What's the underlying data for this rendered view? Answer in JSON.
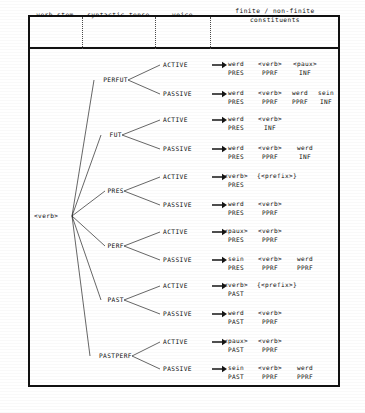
{
  "header": {
    "columns": [
      {
        "label": "verb stem",
        "lines": [
          "verb stem"
        ]
      },
      {
        "label": "syntactic tense",
        "lines": [
          "syntactic tense"
        ]
      },
      {
        "label": "voice",
        "lines": [
          "voice"
        ]
      },
      {
        "label": "finite / non-finite constituents",
        "lines": [
          "finite / non-finite",
          "constituents"
        ]
      }
    ]
  },
  "root": {
    "label": "<verb>"
  },
  "branches": [
    {
      "tense": "PERFUT",
      "voices": [
        {
          "voice": "ACTIVE",
          "constituents": [
            {
              "top": "werd",
              "bot": "PRES"
            },
            {
              "top": "<verb>",
              "bot": "PPRF"
            },
            {
              "top": "<paux>",
              "bot": "INF"
            }
          ]
        },
        {
          "voice": "PASSIVE",
          "constituents": [
            {
              "top": "werd",
              "bot": "PRES"
            },
            {
              "top": "<verb>",
              "bot": "PPRF"
            },
            {
              "top": "werd",
              "bot": "PPRF"
            },
            {
              "top": "sein",
              "bot": "INF"
            }
          ]
        }
      ]
    },
    {
      "tense": "FUT",
      "voices": [
        {
          "voice": "ACTIVE",
          "constituents": [
            {
              "top": "werd",
              "bot": "PRES"
            },
            {
              "top": "<verb>",
              "bot": "INF"
            }
          ]
        },
        {
          "voice": "PASSIVE",
          "constituents": [
            {
              "top": "werd",
              "bot": "PRES"
            },
            {
              "top": "<verb>",
              "bot": "PPRF"
            },
            {
              "top": "werd",
              "bot": "INF"
            }
          ]
        }
      ]
    },
    {
      "tense": "PRES",
      "voices": [
        {
          "voice": "ACTIVE",
          "constituents": [
            {
              "top": "<verb>",
              "bot": "PRES"
            },
            {
              "top": "{<prefix>}",
              "bot": ""
            }
          ]
        },
        {
          "voice": "PASSIVE",
          "constituents": [
            {
              "top": "werd",
              "bot": "PRES"
            },
            {
              "top": "<verb>",
              "bot": "PPRF"
            }
          ]
        }
      ]
    },
    {
      "tense": "PERF",
      "voices": [
        {
          "voice": "ACTIVE",
          "constituents": [
            {
              "top": "<paux>",
              "bot": "PRES"
            },
            {
              "top": "<verb>",
              "bot": "PPRF"
            }
          ]
        },
        {
          "voice": "PASSIVE",
          "constituents": [
            {
              "top": "sein",
              "bot": "PRES"
            },
            {
              "top": "<verb>",
              "bot": "PPRF"
            },
            {
              "top": "werd",
              "bot": "PPRF"
            }
          ]
        }
      ]
    },
    {
      "tense": "PAST",
      "voices": [
        {
          "voice": "ACTIVE",
          "constituents": [
            {
              "top": "<verb>",
              "bot": "PAST"
            },
            {
              "top": "{<prefix>}",
              "bot": ""
            }
          ]
        },
        {
          "voice": "PASSIVE",
          "constituents": [
            {
              "top": "werd",
              "bot": "PAST"
            },
            {
              "top": "<verb>",
              "bot": "PPRF"
            }
          ]
        }
      ]
    },
    {
      "tense": "PASTPERF",
      "voices": [
        {
          "voice": "ACTIVE",
          "constituents": [
            {
              "top": "<paux>",
              "bot": "PAST"
            },
            {
              "top": "<verb>",
              "bot": "PPRF"
            }
          ]
        },
        {
          "voice": "PASSIVE",
          "constituents": [
            {
              "top": "sein",
              "bot": "PAST"
            },
            {
              "top": "<verb>",
              "bot": "PPRF"
            },
            {
              "top": "werd",
              "bot": "PPRF"
            }
          ]
        }
      ]
    }
  ],
  "colors": {
    "ink": "#0d0d0d",
    "rule": "#111111",
    "divider": "#4a4a4a",
    "paper": "#ffffff"
  }
}
